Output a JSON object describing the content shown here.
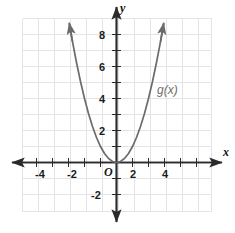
{
  "chart_data": {
    "type": "line",
    "title": "",
    "xlabel": "x",
    "ylabel": "y",
    "function_label": "g(x)",
    "equation": "y = x^2",
    "xlim": [
      -5.875,
      6.0
    ],
    "ylim": [
      -3.125,
      9.625
    ],
    "grid": true,
    "grid_step": 1,
    "legend": "none",
    "x_tick_labels": [
      "-4",
      "-2",
      "2",
      "4"
    ],
    "x_tick_values": [
      -4,
      -2,
      2,
      4
    ],
    "y_tick_labels": [
      "-2",
      "2",
      "4",
      "6",
      "8"
    ],
    "y_tick_values": [
      -2,
      2,
      4,
      6,
      8
    ],
    "minor_tick_values_x": [
      -5,
      -4,
      -3,
      -2,
      -1,
      1,
      2,
      3,
      4,
      5
    ],
    "minor_tick_values_y": [
      -2,
      -1,
      1,
      2,
      3,
      4,
      5,
      6,
      7,
      8,
      9
    ],
    "origin_label": "O",
    "series": [
      {
        "name": "g(x)",
        "color": "#6b6b6b",
        "arrows": "both",
        "x": [
          -2.95,
          -2.75,
          -2.5,
          -2.25,
          -2.0,
          -1.75,
          -1.5,
          -1.25,
          -1.0,
          -0.75,
          -0.5,
          -0.25,
          0,
          0.25,
          0.5,
          0.75,
          1.0,
          1.25,
          1.5,
          1.75,
          2.0,
          2.25,
          2.5,
          2.75,
          2.95
        ],
        "values": [
          8.7,
          7.56,
          6.25,
          5.06,
          4.0,
          3.06,
          2.25,
          1.56,
          1.0,
          0.56,
          0.25,
          0.06,
          0,
          0.06,
          0.25,
          0.56,
          1.0,
          1.56,
          2.25,
          3.06,
          4.0,
          5.06,
          6.25,
          7.56,
          8.7
        ]
      }
    ]
  },
  "axes": {
    "x_axis_name": "x",
    "y_axis_name": "y",
    "origin": "O"
  },
  "labels": {
    "x_neg4": "-4",
    "x_neg2": "-2",
    "x_pos2": "2",
    "x_pos4": "4",
    "y_neg2": "-2",
    "y_pos2": "2",
    "y_pos4": "4",
    "y_pos6": "6",
    "y_pos8": "8",
    "curve": "g(x)"
  },
  "colors": {
    "curve": "#6b6b6b",
    "axis": "#2b2b2b",
    "grid": "#e3e3e8",
    "text": "#1b1b1b",
    "curve_text": "#6e6e6e",
    "background": "#ffffff"
  }
}
